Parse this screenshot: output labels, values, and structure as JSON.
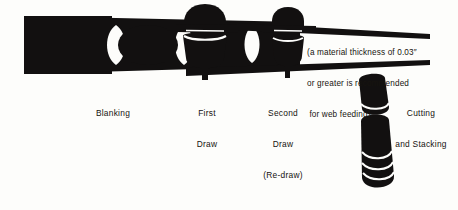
{
  "figure": {
    "kind": "process-flow-diagram",
    "background_color": "#fdfdfb",
    "ink_color": "#121010"
  },
  "callout": {
    "name": "web-feeding-note",
    "lines": [
      "(a material thickness of 0.03″",
      "or greater is recommended",
      " for web feeding)."
    ],
    "line1": "(a material thickness of 0.03″",
    "line2": "or greater is recommended",
    "line3": " for web feeding)."
  },
  "stages": [
    {
      "id": "blanking",
      "label": "Blanking",
      "label_lines": [
        "Blanking"
      ],
      "order": 1
    },
    {
      "id": "first-draw",
      "label": "First Draw",
      "label_lines": [
        "First",
        "Draw"
      ],
      "order": 2
    },
    {
      "id": "second-draw",
      "label": "Second Draw (Re-draw)",
      "label_lines": [
        "Second",
        "Draw",
        "(Re-draw)"
      ],
      "order": 3
    },
    {
      "id": "cutting-and-stacking",
      "label": "Cutting and Stacking",
      "label_lines": [
        "Cutting",
        "and Stacking"
      ],
      "order": 4
    }
  ],
  "stage_labels": {
    "blanking": "Blanking",
    "first_draw_l1": "First",
    "first_draw_l2": "Draw",
    "second_draw_l1": "Second",
    "second_draw_l2": "Draw",
    "second_draw_l3": "(Re-draw)",
    "cutting_l1": "Cutting",
    "cutting_l2": "and Stacking"
  }
}
